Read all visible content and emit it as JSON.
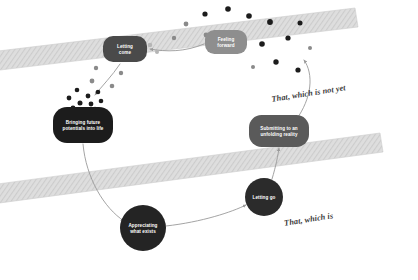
{
  "diagram": {
    "background": "#ffffff",
    "width": 418,
    "height": 280
  },
  "palette": {
    "node_dark": "#1c1c1c",
    "node_mid": "#4a4a4a",
    "node_grey": "#5a5a5a",
    "node_light": "#8e8e8e",
    "band_fill": "#dcdcdc",
    "band_stroke": "#c9c9c9",
    "dot_dark": "#1c1c1c",
    "dot_mid": "#8a8a8a",
    "dot_light": "#b5b5b5",
    "arrow": "#9a9a9a",
    "band_text": "#3a3a3a",
    "node_text": "#ffffff"
  },
  "bands": [
    {
      "id": "band-upper",
      "label": "That, which is not yet",
      "label_x": 309,
      "label_y": 96,
      "label_rotation": -9
    },
    {
      "id": "band-lower",
      "label": "That, which is",
      "label_x": 309,
      "label_y": 222,
      "label_rotation": -9
    }
  ],
  "nodes": [
    {
      "id": "letting-come",
      "label": "Letting come",
      "lines": [
        "Letting",
        "come"
      ],
      "shape": "rounded-rect",
      "cx": 125,
      "cy": 49,
      "rx": 22,
      "ry": 13,
      "fill": "#4a4a4a"
    },
    {
      "id": "feeling-forward",
      "label": "Feeling forward",
      "lines": [
        "Feeling",
        "forward"
      ],
      "shape": "rounded-rect",
      "cx": 226,
      "cy": 42,
      "rx": 21,
      "ry": 12,
      "fill": "#8e8e8e"
    },
    {
      "id": "bringing-future-potentials",
      "label": "Bringing future potentials into life",
      "lines": [
        "Bringing future",
        "potentials into life"
      ],
      "shape": "rounded-rect",
      "cx": 83,
      "cy": 125,
      "rx": 30,
      "ry": 18,
      "fill": "#1c1c1c"
    },
    {
      "id": "submitting-unfolding-reality",
      "label": "Submitting to an unfolding reality",
      "lines": [
        "Submitting to an",
        "unfolding reality"
      ],
      "shape": "rounded-rect",
      "cx": 279,
      "cy": 131,
      "rx": 30,
      "ry": 16,
      "fill": "#5a5a5a"
    },
    {
      "id": "letting-go",
      "label": "Letting go",
      "lines": [
        "Letting go"
      ],
      "shape": "circle",
      "cx": 264,
      "cy": 197,
      "rx": 19,
      "ry": 19,
      "fill": "#2b2b2b"
    },
    {
      "id": "appreciating-what-exists",
      "label": "Appreciating what exists",
      "lines": [
        "Appreciating",
        "what exists"
      ],
      "shape": "circle",
      "cx": 143,
      "cy": 228,
      "rx": 23,
      "ry": 23,
      "fill": "#242424"
    }
  ],
  "dots": [
    {
      "x": 205,
      "y": 14,
      "r": 2.6,
      "tone": "dot_dark"
    },
    {
      "x": 228,
      "y": 9,
      "r": 2.8,
      "tone": "dot_dark"
    },
    {
      "x": 249,
      "y": 16,
      "r": 2.8,
      "tone": "dot_dark"
    },
    {
      "x": 270,
      "y": 22,
      "r": 2.9,
      "tone": "dot_dark"
    },
    {
      "x": 186,
      "y": 24,
      "r": 2.4,
      "tone": "dot_mid"
    },
    {
      "x": 206,
      "y": 35,
      "r": 2.4,
      "tone": "dot_mid"
    },
    {
      "x": 174,
      "y": 38,
      "r": 2.2,
      "tone": "dot_mid"
    },
    {
      "x": 262,
      "y": 44,
      "r": 2.8,
      "tone": "dot_dark"
    },
    {
      "x": 288,
      "y": 38,
      "r": 2.6,
      "tone": "dot_dark"
    },
    {
      "x": 300,
      "y": 23,
      "r": 2.5,
      "tone": "dot_dark"
    },
    {
      "x": 276,
      "y": 62,
      "r": 2.7,
      "tone": "dot_dark"
    },
    {
      "x": 298,
      "y": 70,
      "r": 2.6,
      "tone": "dot_dark"
    },
    {
      "x": 253,
      "y": 67,
      "r": 2.0,
      "tone": "dot_mid"
    },
    {
      "x": 310,
      "y": 48,
      "r": 2.0,
      "tone": "dot_mid"
    },
    {
      "x": 150,
      "y": 45,
      "r": 2.3,
      "tone": "dot_light"
    },
    {
      "x": 157,
      "y": 52,
      "r": 2.0,
      "tone": "dot_light"
    },
    {
      "x": 96,
      "y": 68,
      "r": 2.2,
      "tone": "dot_mid"
    },
    {
      "x": 121,
      "y": 73,
      "r": 2.2,
      "tone": "dot_mid"
    },
    {
      "x": 92,
      "y": 81,
      "r": 2.4,
      "tone": "dot_mid"
    },
    {
      "x": 112,
      "y": 86,
      "r": 2.3,
      "tone": "dot_mid"
    },
    {
      "x": 77,
      "y": 90,
      "r": 2.3,
      "tone": "dot_dark"
    },
    {
      "x": 88,
      "y": 96,
      "r": 2.4,
      "tone": "dot_dark"
    },
    {
      "x": 98,
      "y": 92,
      "r": 2.3,
      "tone": "dot_dark"
    },
    {
      "x": 69,
      "y": 98,
      "r": 2.4,
      "tone": "dot_dark"
    },
    {
      "x": 80,
      "y": 103,
      "r": 2.5,
      "tone": "dot_dark"
    },
    {
      "x": 91,
      "y": 104,
      "r": 2.4,
      "tone": "dot_dark"
    },
    {
      "x": 101,
      "y": 101,
      "r": 2.3,
      "tone": "dot_dark"
    },
    {
      "x": 73,
      "y": 108,
      "r": 2.4,
      "tone": "dot_dark"
    },
    {
      "x": 84,
      "y": 110,
      "r": 2.3,
      "tone": "dot_dark"
    },
    {
      "x": 95,
      "y": 109,
      "r": 2.2,
      "tone": "dot_dark"
    }
  ],
  "connectors": [
    {
      "id": "feeling-to-letting-come",
      "path": "M 204 44 C 185 52 166 52 150 49"
    },
    {
      "id": "letting-come-to-bringing",
      "path": "M 120 64 C 112 76 102 86 95 95"
    },
    {
      "id": "bringing-to-appreciating",
      "path": "M 83 144 C 86 178 104 208 124 221"
    },
    {
      "id": "appreciating-to-letting-go",
      "path": "M 166 226 C 202 222 232 212 246 205"
    },
    {
      "id": "letting-go-to-submitting",
      "path": "M 272 179 C 276 166 278 155 279 148"
    },
    {
      "id": "submitting-to-feeling",
      "path": "M 296 120 C 312 98 314 74 304 60"
    }
  ]
}
